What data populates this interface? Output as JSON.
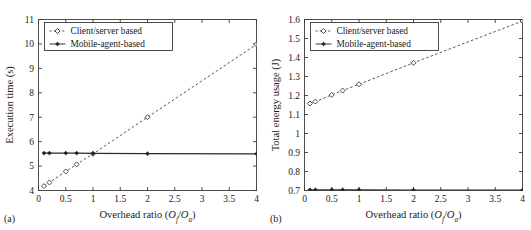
{
  "figure": {
    "panels": [
      {
        "key": "a",
        "subfig_label": "(a)",
        "legend": {
          "position": "top-left",
          "entries": [
            {
              "label": "Client/server based",
              "marker": "open-diamond-icon",
              "line": "dashed"
            },
            {
              "label": "Mobile-agent-based",
              "marker": "filled-star-icon",
              "line": "solid"
            }
          ]
        }
      },
      {
        "key": "b",
        "subfig_label": "(b)",
        "legend": {
          "position": "top-left",
          "entries": [
            {
              "label": "Client/server based",
              "marker": "open-diamond-icon",
              "line": "dashed"
            },
            {
              "label": "Mobile-agent-based",
              "marker": "filled-star-icon",
              "line": "solid"
            }
          ]
        }
      }
    ],
    "colors": {
      "background": "#ffffff",
      "axis": "#3a3a3a",
      "client_server_series": "#3c3c3c",
      "mobile_agent_series": "#2b2b2b",
      "text": "#1a1a1a"
    }
  },
  "chart_data": [
    {
      "type": "line",
      "title": "",
      "panel": "(a)",
      "xlabel": "Overhead ratio (Of/Oa)",
      "xlabel_parts": {
        "text": "Overhead ratio (",
        "num": "O",
        "num_sub": "f",
        "slash": "/",
        "den": "O",
        "den_sub": "a",
        "close": ")"
      },
      "ylabel": "Execution time (s)",
      "xlim": [
        0,
        4
      ],
      "ylim": [
        4,
        11
      ],
      "xticks": [
        0,
        0.5,
        1,
        1.5,
        2,
        2.5,
        3,
        3.5,
        4
      ],
      "xticklabels": [
        "0",
        "0.5",
        "1",
        "1.5",
        "2",
        "2.5",
        "3",
        "3.5",
        "4"
      ],
      "yticks": [
        4,
        5,
        6,
        7,
        8,
        9,
        10,
        11
      ],
      "yticklabels": [
        "4",
        "5",
        "6",
        "7",
        "8",
        "9",
        "10",
        "11"
      ],
      "grid": false,
      "legend_position": "upper left",
      "x": [
        0.1,
        0.2,
        0.5,
        0.7,
        1,
        2,
        4
      ],
      "series": [
        {
          "name": "Client/server based",
          "linestyle": "dashed",
          "marker": "open-diamond",
          "values": [
            4.18,
            4.33,
            4.78,
            5.07,
            5.5,
            7.0,
            9.98
          ]
        },
        {
          "name": "Mobile-agent-based",
          "linestyle": "solid",
          "marker": "filled-star",
          "values": [
            5.53,
            5.53,
            5.53,
            5.53,
            5.52,
            5.51,
            5.5
          ]
        }
      ]
    },
    {
      "type": "line",
      "title": "",
      "panel": "(b)",
      "xlabel": "Overhead ratio (Of/Oa)",
      "xlabel_parts": {
        "text": "Overhead ratio (",
        "num": "O",
        "num_sub": "f",
        "slash": "/",
        "den": "O",
        "den_sub": "a",
        "close": ")"
      },
      "ylabel": "Total energy usage (J)",
      "xlim": [
        0,
        4
      ],
      "ylim": [
        0.7,
        1.6
      ],
      "xticks": [
        0,
        0.5,
        1,
        1.5,
        2,
        2.5,
        3,
        3.5,
        4
      ],
      "xticklabels": [
        "0",
        "0.5",
        "1",
        "1.5",
        "2",
        "2.5",
        "3",
        "3.5",
        "4"
      ],
      "yticks": [
        0.7,
        0.8,
        0.9,
        1.0,
        1.1,
        1.2,
        1.3,
        1.4,
        1.5,
        1.6
      ],
      "yticklabels": [
        "0.7",
        "0.8",
        "0.9",
        "1",
        "1.1",
        "1.2",
        "1.3",
        "1.4",
        "1.5",
        "1.6"
      ],
      "grid": false,
      "legend_position": "upper left",
      "x": [
        0.1,
        0.2,
        0.5,
        0.7,
        1,
        2,
        4
      ],
      "series": [
        {
          "name": "Client/server based",
          "linestyle": "dashed",
          "marker": "open-diamond",
          "values": [
            1.158,
            1.168,
            1.203,
            1.226,
            1.259,
            1.372,
            1.592
          ]
        },
        {
          "name": "Mobile-agent-based",
          "linestyle": "solid",
          "marker": "filled-star",
          "values": [
            0.704,
            0.704,
            0.704,
            0.704,
            0.704,
            0.703,
            0.702
          ]
        }
      ]
    }
  ]
}
